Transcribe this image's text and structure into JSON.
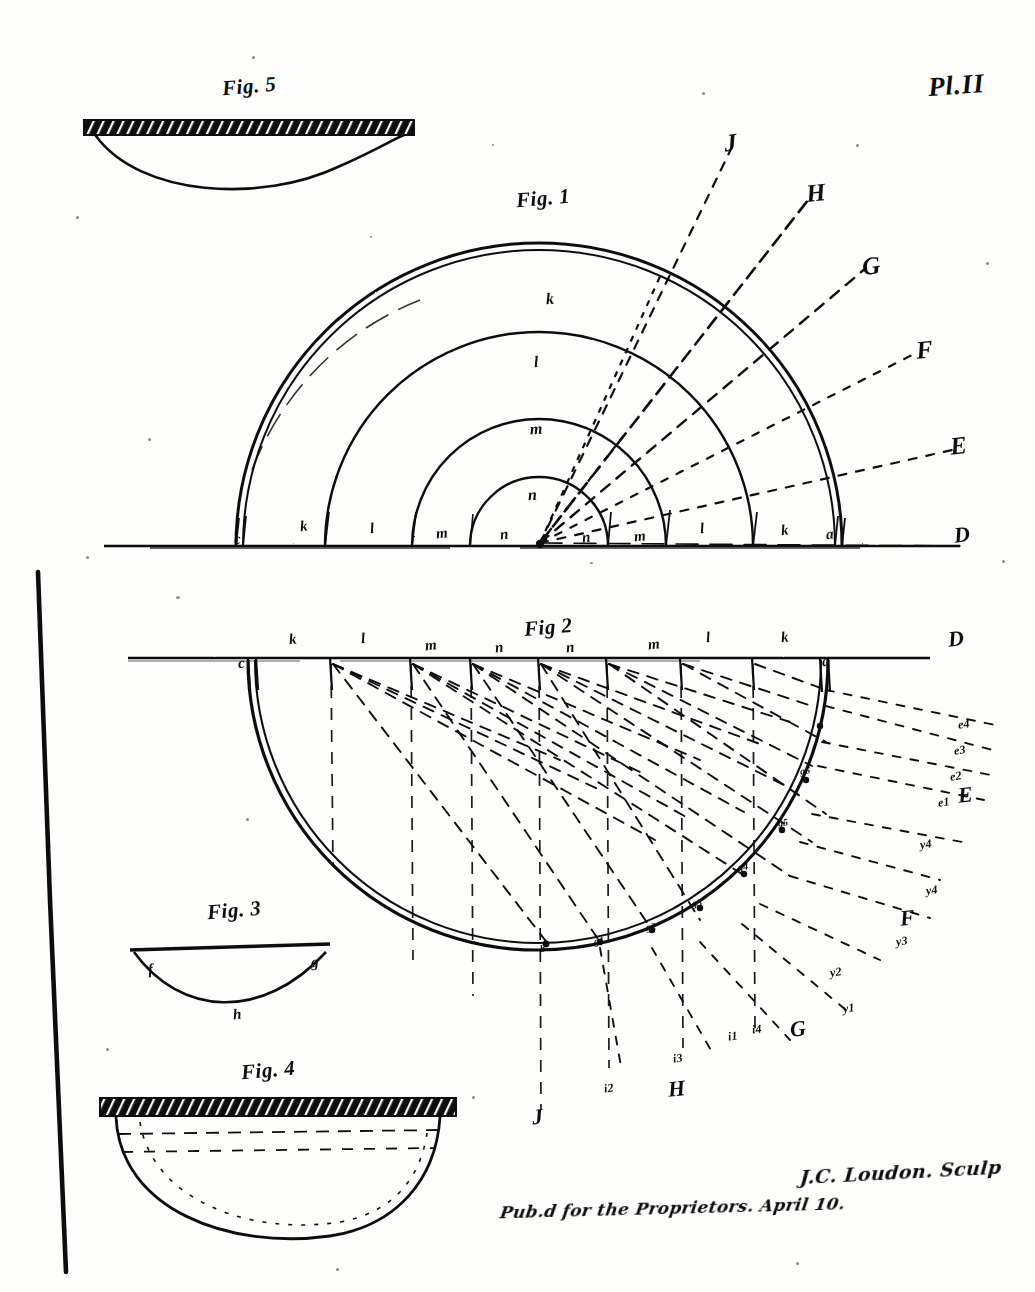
{
  "plate": {
    "number_label": "Pl.II",
    "background_color": "#fdfdfc",
    "ink_color": "#0d0d0d"
  },
  "figures": [
    {
      "id": "fig5",
      "title": "Fig. 5",
      "description": "hatched horizontal bar above a shallow bowl curve"
    },
    {
      "id": "fig1",
      "title": "Fig. 1",
      "description": "concentric semicircular arcs above a baseline with radiating dashed rays",
      "arc_zone_labels": [
        "k",
        "l",
        "m",
        "n"
      ],
      "baseline_labels_left": [
        "c",
        "k",
        "l",
        "m",
        "n"
      ],
      "baseline_labels_right": [
        "n",
        "m",
        "l",
        "k",
        "a"
      ],
      "ray_labels": [
        "J",
        "H",
        "G",
        "F",
        "E",
        "D"
      ]
    },
    {
      "id": "fig2",
      "title": "Fig 2",
      "description": "large semicircle below a horizontal datum line with many dashed rays converging on the arc",
      "top_labels_left": [
        "c",
        "k",
        "l",
        "m",
        "n"
      ],
      "top_labels_right": [
        "n",
        "m",
        "l",
        "k",
        "a"
      ],
      "datum_label": "D",
      "ray_groups": [
        {
          "letter": "E",
          "points": [
            "e1",
            "e2",
            "e3",
            "e4"
          ]
        },
        {
          "letter": "F",
          "points": [
            "y1",
            "y2",
            "y3",
            "y4"
          ]
        },
        {
          "letter": "G",
          "points": [
            "i1",
            "i4"
          ]
        },
        {
          "letter": "H",
          "points": [
            "i2",
            "i3"
          ]
        },
        {
          "letter": "J",
          "points": []
        }
      ],
      "arc_point_labels": [
        "b",
        "g1",
        "g2",
        "g3",
        "g4",
        "g5",
        "g6"
      ]
    },
    {
      "id": "fig3",
      "title": "Fig. 3",
      "description": "straight top chord with a sagging curve below",
      "point_labels": [
        "f",
        "g",
        "h"
      ]
    },
    {
      "id": "fig4",
      "title": "Fig. 4",
      "description": "hatched horizontal bar above a deep bowl with dotted interior lines"
    }
  ],
  "imprint": {
    "signature": "J.C. Loudon. Sculp",
    "caption": "Pub.d for the Proprietors. April 10."
  }
}
